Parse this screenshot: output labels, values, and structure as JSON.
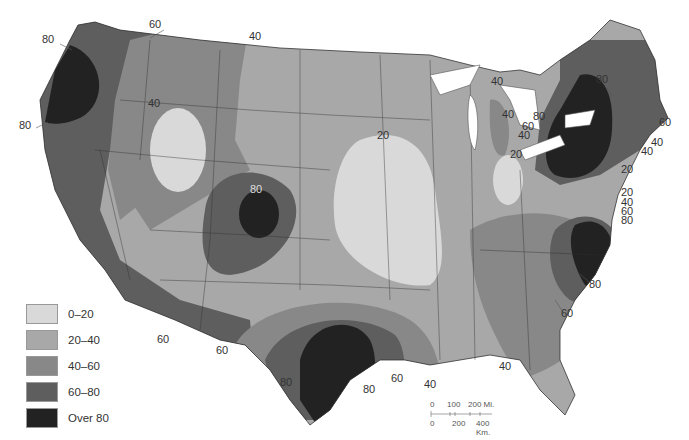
{
  "map": {
    "type": "choropleth",
    "subject": "Contiguous United States isoline map",
    "colors": {
      "0-20": "#d9d9d9",
      "20-40": "#a8a8a8",
      "40-60": "#888888",
      "60-80": "#5e5e5e",
      "over-80": "#222222",
      "water": "#ffffff",
      "border": "#333333"
    }
  },
  "legend": {
    "items": [
      {
        "label": "0–20",
        "color": "#d9d9d9"
      },
      {
        "label": "20–40",
        "color": "#a8a8a8"
      },
      {
        "label": "40–60",
        "color": "#888888"
      },
      {
        "label": "60–80",
        "color": "#5e5e5e"
      },
      {
        "label": "Over 80",
        "color": "#222222"
      }
    ]
  },
  "scale_bar": {
    "miles": {
      "ticks": [
        "0",
        "100",
        "200 Mi."
      ]
    },
    "kilometers": {
      "ticks": [
        "0",
        "200",
        "400 Km."
      ]
    }
  },
  "isoline_labels": [
    {
      "text": "80",
      "x": 48,
      "y": 40
    },
    {
      "text": "60",
      "x": 155,
      "y": 25
    },
    {
      "text": "40",
      "x": 255,
      "y": 37
    },
    {
      "text": "40",
      "x": 154,
      "y": 104
    },
    {
      "text": "80",
      "x": 25,
      "y": 126
    },
    {
      "text": "20",
      "x": 383,
      "y": 136
    },
    {
      "text": "80",
      "x": 256,
      "y": 190
    },
    {
      "text": "40",
      "x": 497,
      "y": 82
    },
    {
      "text": "80",
      "x": 602,
      "y": 80
    },
    {
      "text": "40",
      "x": 508,
      "y": 115
    },
    {
      "text": "80",
      "x": 539,
      "y": 117
    },
    {
      "text": "60",
      "x": 528,
      "y": 127
    },
    {
      "text": "40",
      "x": 524,
      "y": 136
    },
    {
      "text": "20",
      "x": 516,
      "y": 155
    },
    {
      "text": "60",
      "x": 665,
      "y": 123
    },
    {
      "text": "40",
      "x": 657,
      "y": 143
    },
    {
      "text": "40",
      "x": 647,
      "y": 152
    },
    {
      "text": "20",
      "x": 627,
      "y": 170
    },
    {
      "text": "20",
      "x": 627,
      "y": 193
    },
    {
      "text": "40",
      "x": 627,
      "y": 203
    },
    {
      "text": "60",
      "x": 627,
      "y": 212
    },
    {
      "text": "80",
      "x": 627,
      "y": 221
    },
    {
      "text": "80",
      "x": 595,
      "y": 285
    },
    {
      "text": "60",
      "x": 567,
      "y": 314
    },
    {
      "text": "40",
      "x": 505,
      "y": 367
    },
    {
      "text": "60",
      "x": 163,
      "y": 340
    },
    {
      "text": "60",
      "x": 222,
      "y": 351
    },
    {
      "text": "80",
      "x": 286,
      "y": 383
    },
    {
      "text": "80",
      "x": 369,
      "y": 390
    },
    {
      "text": "60",
      "x": 397,
      "y": 379
    },
    {
      "text": "40",
      "x": 430,
      "y": 385
    }
  ]
}
